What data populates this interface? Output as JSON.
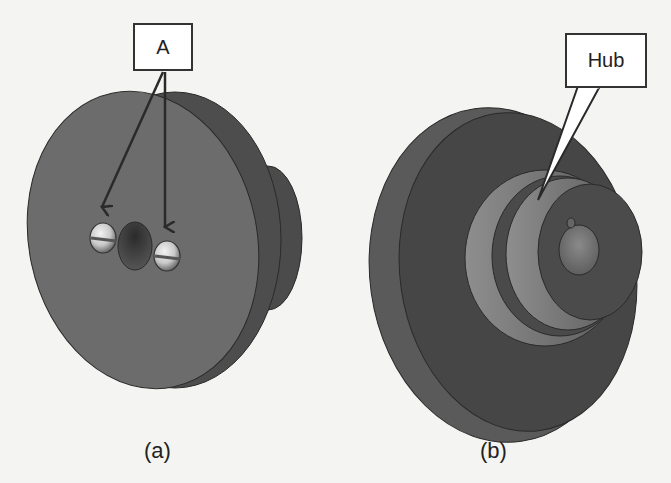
{
  "figure": {
    "panels": [
      {
        "id": "a",
        "caption": "(a)",
        "callout_label": "A",
        "callout_targets": [
          "left-screw",
          "right-screw"
        ],
        "description": "Front view of disc with two slotted screws and central hole"
      },
      {
        "id": "b",
        "caption": "(b)",
        "callout_label": "Hub",
        "callout_targets": [
          "hub"
        ],
        "description": "Rear view of disc showing stepped hub with keyed bore"
      }
    ]
  },
  "colors": {
    "background": "#f4f4f2",
    "disc_face": "#6b6b6b",
    "disc_rim": "#4a4a4a",
    "disc_dark": "#3e3e3e",
    "hub_light": "#8a8a8a",
    "screw_light": "#dcdcdc",
    "outline": "#2a2a2a"
  }
}
